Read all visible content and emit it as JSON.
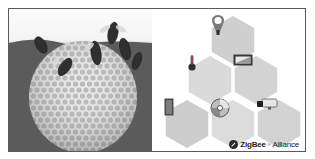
{
  "figure": {
    "left_image": {
      "subject": "honeybees on a rounded honeycomb",
      "style": "grayscale photo"
    },
    "right_panel": {
      "layout": "hexagon pyramid (1-2-3)",
      "hexagons": [
        {
          "position": "top",
          "icon": "light-bulb-icon"
        },
        {
          "position": "middle-left",
          "icon": "thermometer-sensor-icon"
        },
        {
          "position": "middle-right",
          "icon": "light-switch-icon"
        },
        {
          "position": "bottom-left",
          "icon": "door-sensor-icon"
        },
        {
          "position": "bottom-center",
          "icon": "disc-media-icon"
        },
        {
          "position": "bottom-right",
          "icon": "security-camera-icon"
        }
      ],
      "hex_fill": "#cfcfcf",
      "hex_fill_alt": "#dadada",
      "hex_border": "#ffffff"
    },
    "logo": {
      "brand": "ZigBee",
      "trademark": "®",
      "suffix": " Alliance"
    }
  }
}
